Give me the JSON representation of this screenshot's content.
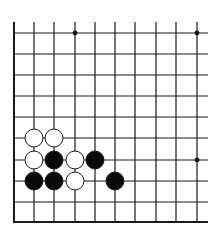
{
  "diagram": {
    "type": "go-board-fragment",
    "colors": {
      "line": "#1a1a1a",
      "black_stone": "#0a0a0a",
      "white_stone": "#ffffff",
      "background": "#ffffff"
    },
    "grid": {
      "x_lines": [
        14,
        34,
        54,
        75,
        95,
        115,
        135,
        156,
        176,
        197
      ],
      "y_lines": [
        33,
        54,
        75,
        96,
        117,
        138,
        160,
        181,
        202
      ],
      "left_edge_x": 14,
      "bottom_edge_y": 222,
      "top_extent_y": 22,
      "right_extent_x": 208
    },
    "star_points": [
      {
        "x": 75,
        "y": 33
      },
      {
        "x": 197,
        "y": 33
      },
      {
        "x": 197,
        "y": 160
      }
    ],
    "stones": [
      {
        "color": "white",
        "x": 34,
        "y": 138
      },
      {
        "color": "white",
        "x": 54,
        "y": 138
      },
      {
        "color": "white",
        "x": 34,
        "y": 160
      },
      {
        "color": "black",
        "x": 54,
        "y": 160
      },
      {
        "color": "white",
        "x": 75,
        "y": 160
      },
      {
        "color": "black",
        "x": 95,
        "y": 160
      },
      {
        "color": "black",
        "x": 34,
        "y": 181
      },
      {
        "color": "black",
        "x": 54,
        "y": 181
      },
      {
        "color": "white",
        "x": 75,
        "y": 181
      },
      {
        "color": "black",
        "x": 115,
        "y": 181
      }
    ],
    "stone_radius": 9
  }
}
